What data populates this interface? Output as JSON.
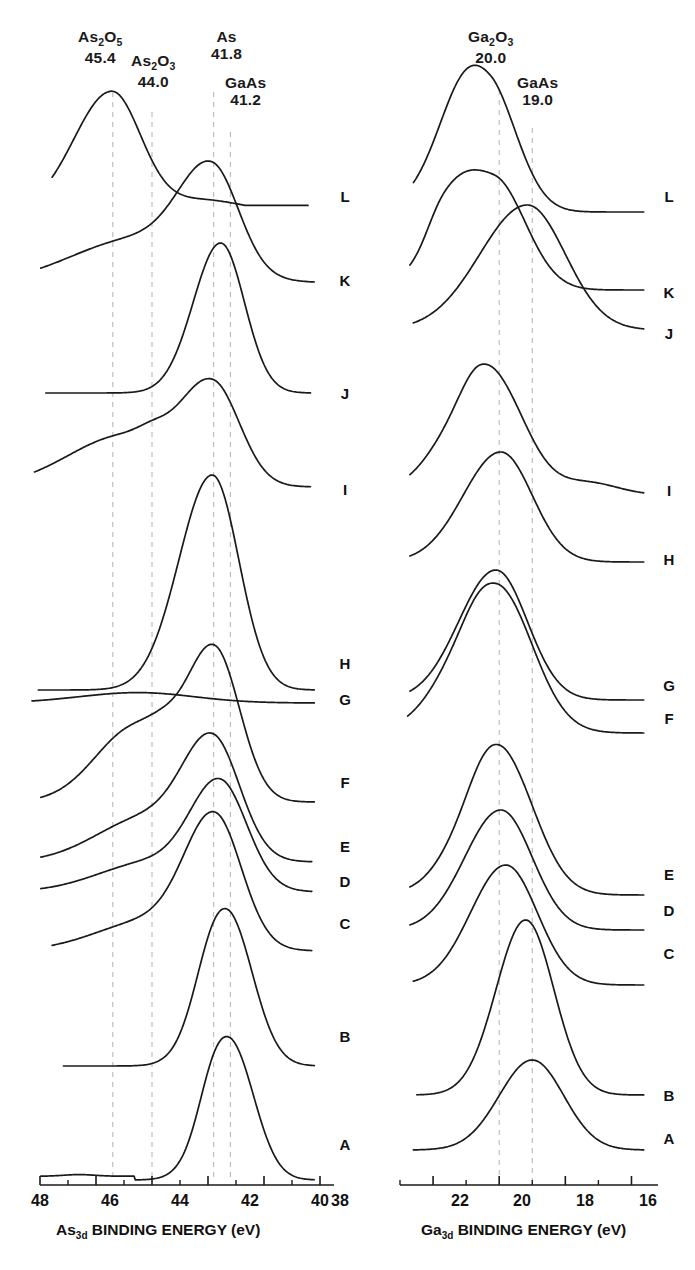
{
  "figure": {
    "type": "xps-spectra-stack",
    "panels": [
      "as3d",
      "ga3d"
    ]
  },
  "panel_left": {
    "axis_title_prefix": "As",
    "axis_title_sub": "3d",
    "axis_title_rest": " BINDING ENERGY (eV)",
    "tick_labels": [
      "48",
      "46",
      "44",
      "42",
      "40",
      "38"
    ],
    "markers": [
      {
        "species": "As",
        "sub1": "2",
        "species2": "O",
        "sub2": "5",
        "value": "45.4"
      },
      {
        "species": "As",
        "sub1": "2",
        "species2": "O",
        "sub2": "3",
        "value": "44.0"
      },
      {
        "species": "As",
        "sub1": "",
        "species2": "",
        "sub2": "",
        "value": "41.8"
      },
      {
        "species": "GaAs",
        "sub1": "",
        "species2": "",
        "sub2": "",
        "value": "41.2"
      }
    ],
    "curve_labels": [
      "L",
      "K",
      "J",
      "I",
      "H",
      "G",
      "F",
      "E",
      "D",
      "C",
      "B",
      "A"
    ]
  },
  "panel_right": {
    "axis_title_prefix": "Ga",
    "axis_title_sub": "3d",
    "axis_title_rest": " BINDING ENERGY (eV)",
    "tick_labels": [
      "22",
      "20",
      "18",
      "16"
    ],
    "markers": [
      {
        "species": "Ga",
        "sub1": "2",
        "species2": "O",
        "sub2": "3",
        "value": "20.0"
      },
      {
        "species": "GaAs",
        "sub1": "",
        "species2": "",
        "sub2": "",
        "value": "19.0"
      }
    ],
    "curve_labels": [
      "L",
      "K",
      "J",
      "I",
      "H",
      "G",
      "F",
      "E",
      "D",
      "C",
      "B",
      "A"
    ]
  },
  "chart_data": {
    "type": "line",
    "title": "",
    "panels": [
      {
        "id": "as3d",
        "xlabel": "As3d BINDING ENERGY (eV)",
        "ylabel": "",
        "xlim": [
          48,
          38
        ],
        "xticks": [
          48,
          46,
          44,
          42,
          40,
          38
        ],
        "xminorticks": [
          47,
          45,
          43,
          41,
          39
        ],
        "grid": false,
        "reference_lines": [
          {
            "label": "As2O5",
            "x": 45.4
          },
          {
            "label": "As2O3",
            "x": 44.0
          },
          {
            "label": "As",
            "x": 41.8
          },
          {
            "label": "GaAs",
            "x": 41.2
          }
        ],
        "series": [
          {
            "name": "L",
            "peaks": [
              45.4
            ],
            "shape": "broad asymmetric peak at 45.4 with tail to 41.2"
          },
          {
            "name": "K",
            "peaks": [
              41.8
            ],
            "shape": "rising ramp with shoulder near 45.4, peak 41.8"
          },
          {
            "name": "J",
            "peaks": [
              41.5
            ],
            "shape": "tall peak near 41.5"
          },
          {
            "name": "I",
            "peaks": [
              41.8
            ],
            "shape": "broad plateau 46-44 with peak at 41.8"
          },
          {
            "name": "H",
            "peaks": [
              41.8
            ],
            "shape": "single strong sharp peak at 41.8"
          },
          {
            "name": "G",
            "peaks": [
              44.5
            ],
            "shape": "very broad flat low hump near 44.5"
          },
          {
            "name": "F",
            "peaks": [
              41.8
            ],
            "shape": "peak at 41.8 with broad shoulder 45-44"
          },
          {
            "name": "E",
            "peaks": [
              41.8
            ],
            "shape": "peak at 41.8 with shoulder near 44"
          },
          {
            "name": "D",
            "peaks": [
              41.4
            ],
            "shape": "peak at 41.4 with weak shoulder"
          },
          {
            "name": "C",
            "peaks": [
              41.8
            ],
            "shape": "peak at 41.8 slightly broadened"
          },
          {
            "name": "B",
            "peaks": [
              41.3
            ],
            "shape": "strong narrow peak at 41.3"
          },
          {
            "name": "A",
            "peaks": [
              41.2
            ],
            "shape": "clean single GaAs peak at 41.2, flat baseline"
          }
        ]
      },
      {
        "id": "ga3d",
        "xlabel": "Ga3d BINDING ENERGY (eV)",
        "ylabel": "",
        "xlim": [
          23,
          15.5
        ],
        "xticks": [
          22,
          20,
          18,
          16
        ],
        "xminorticks": [
          23,
          21,
          19,
          17
        ],
        "grid": false,
        "reference_lines": [
          {
            "label": "Ga2O3",
            "x": 20.0
          },
          {
            "label": "GaAs",
            "x": 19.0
          }
        ],
        "series": [
          {
            "name": "L",
            "peaks": [
              20.2
            ],
            "shape": "broad peak at 20.2 with long tail"
          },
          {
            "name": "K",
            "peaks": [
              20.1
            ],
            "shape": "broad peak at 20.1 with shoulder"
          },
          {
            "name": "J",
            "peaks": [
              19.1
            ],
            "shape": "broad peak at 19.1"
          },
          {
            "name": "I",
            "peaks": [
              20.2
            ],
            "shape": "broad flat-top peak near 20.2"
          },
          {
            "name": "H",
            "peaks": [
              19.9
            ],
            "shape": "peak at 19.9"
          },
          {
            "name": "G",
            "peaks": [
              20.1
            ],
            "shape": "peak at 20.1"
          },
          {
            "name": "F",
            "peaks": [
              20.0
            ],
            "shape": "broad flat-top peak at 20.0"
          },
          {
            "name": "E",
            "peaks": [
              19.9
            ],
            "shape": "peak at 19.9"
          },
          {
            "name": "D",
            "peaks": [
              20.0
            ],
            "shape": "peak at 20.0"
          },
          {
            "name": "C",
            "peaks": [
              19.8
            ],
            "shape": "peak at 19.8"
          },
          {
            "name": "B",
            "peaks": [
              19.2
            ],
            "shape": "tall narrow peak at 19.2"
          },
          {
            "name": "A",
            "peaks": [
              19.0
            ],
            "shape": "broad low GaAs peak at 19.0"
          }
        ]
      }
    ]
  },
  "colors": {
    "ink": "#1a1a1a",
    "dashed_guide": "#b9b9b9"
  }
}
